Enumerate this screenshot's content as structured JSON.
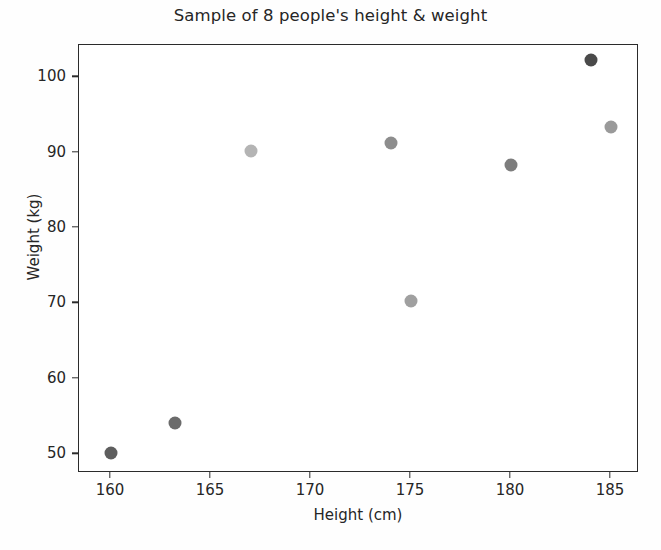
{
  "chart_data": {
    "type": "scatter",
    "title": "Sample of 8 people's height & weight",
    "xlabel": "Height (cm)",
    "ylabel": "Weight (kg)",
    "xlim": [
      158.4,
      186.4
    ],
    "ylim": [
      47.5,
      104.3
    ],
    "grid": false,
    "legend": "none",
    "xticks": [
      160,
      165,
      170,
      175,
      180,
      185
    ],
    "xtick_labels": [
      "160",
      "165",
      "170",
      "175",
      "180",
      "185"
    ],
    "yticks": [
      50,
      60,
      70,
      80,
      90,
      100
    ],
    "ytick_labels": [
      "50",
      "60",
      "70",
      "80",
      "90",
      "100"
    ],
    "marker": "circle",
    "marker_size": 13,
    "points": [
      {
        "x": 160.0,
        "y": 50.1,
        "color": "#5e5e5e"
      },
      {
        "x": 163.2,
        "y": 54.2,
        "color": "#6b6b6b"
      },
      {
        "x": 167.0,
        "y": 90.2,
        "color": "#b4b4b4"
      },
      {
        "x": 174.0,
        "y": 91.3,
        "color": "#8d8d8d"
      },
      {
        "x": 175.0,
        "y": 70.3,
        "color": "#a0a0a0"
      },
      {
        "x": 180.0,
        "y": 88.4,
        "color": "#7d7d7d"
      },
      {
        "x": 184.0,
        "y": 102.3,
        "color": "#4a4a4a"
      },
      {
        "x": 185.0,
        "y": 93.4,
        "color": "#9a9a9a"
      }
    ],
    "x_values": [
      160.0,
      163.2,
      167.0,
      174.0,
      175.0,
      180.0,
      184.0,
      185.0
    ],
    "y_values": [
      50.1,
      54.2,
      90.2,
      91.3,
      70.3,
      88.4,
      102.3,
      93.4
    ]
  },
  "style": {
    "background": "#ffffff",
    "axis_color": "#2b2b2b",
    "text_color": "#262626"
  }
}
